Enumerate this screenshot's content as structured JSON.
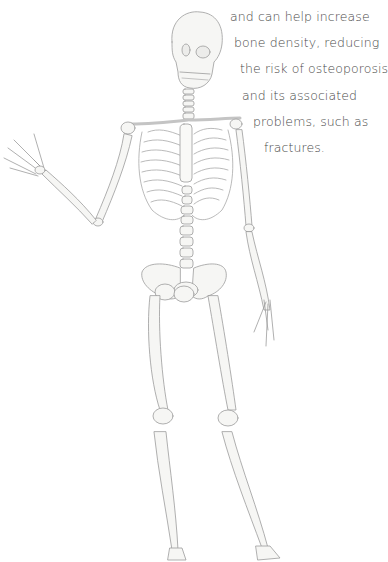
{
  "illustration": {
    "subject": "human skeleton, pencil drawing, waving right hand",
    "colors": {
      "background": "#ffffff",
      "bone_fill": "#f6f6f4",
      "bone_line": "#9a9a9a",
      "text": "#4a4a4a"
    }
  },
  "caption": {
    "cut_line": "",
    "lines": [
      "and can help increase",
      "bone density, reducing",
      "the risk of osteoporosis",
      "and its associated",
      "problems, such as",
      "fractures."
    ]
  }
}
